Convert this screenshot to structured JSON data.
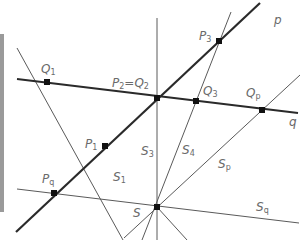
{
  "diagram": {
    "center": {
      "name": "S",
      "x": 157,
      "y": 207
    },
    "lines": [
      {
        "id": "p",
        "label": "p",
        "style": "thick",
        "x1": 16,
        "y1": 232,
        "x2": 260,
        "y2": 3
      },
      {
        "id": "q",
        "label": "q",
        "style": "thick",
        "x1": 17,
        "y1": 79,
        "x2": 298,
        "y2": 113
      },
      {
        "id": "S1",
        "label": "S1",
        "style": "thin",
        "x1": 17,
        "y1": 48,
        "x2": 123,
        "y2": 240
      },
      {
        "id": "S3",
        "label": "S3",
        "style": "thin",
        "x1": 157,
        "y1": 18,
        "x2": 157,
        "y2": 240
      },
      {
        "id": "S4",
        "label": "S4",
        "style": "thin",
        "x1": 231,
        "y1": 12,
        "x2": 142,
        "y2": 240
      },
      {
        "id": "Sp",
        "label": "Sp",
        "style": "thin",
        "x1": 300,
        "y1": 75,
        "x2": 124,
        "y2": 238
      },
      {
        "id": "Sq",
        "label": "Sq",
        "style": "thin",
        "x1": 17,
        "y1": 189,
        "x2": 299,
        "y2": 223
      },
      {
        "id": "extra",
        "label": "",
        "style": "thin",
        "x1": 157,
        "y1": 207,
        "x2": 187,
        "y2": 240
      }
    ],
    "points": [
      {
        "name": "Q1",
        "x": 47,
        "y": 82
      },
      {
        "name": "P2=Q2",
        "x": 157,
        "y": 98
      },
      {
        "name": "Q3",
        "x": 196,
        "y": 101
      },
      {
        "name": "Qp",
        "x": 262,
        "y": 110
      },
      {
        "name": "P3",
        "x": 219,
        "y": 41
      },
      {
        "name": "P1",
        "x": 105,
        "y": 146
      },
      {
        "name": "Pq",
        "x": 54,
        "y": 193
      },
      {
        "name": "S",
        "x": 157,
        "y": 207
      }
    ],
    "labels": {
      "p": {
        "main": "p",
        "sub": ""
      },
      "q": {
        "main": "q",
        "sub": ""
      },
      "Q1": {
        "main": "Q",
        "sub": "1"
      },
      "P2Q2": {
        "main": "P",
        "sub": "2",
        "eq": "=Q",
        "sub2": "2"
      },
      "Q3": {
        "main": "Q",
        "sub": "3"
      },
      "Qp": {
        "main": "Q",
        "sub": "p"
      },
      "P3": {
        "main": "P",
        "sub": "3"
      },
      "P1": {
        "main": "P",
        "sub": "1"
      },
      "Pq": {
        "main": "P",
        "sub": "q"
      },
      "S": {
        "main": "S",
        "sub": ""
      },
      "S1": {
        "main": "S",
        "sub": "1"
      },
      "S3": {
        "main": "S",
        "sub": "3"
      },
      "S4": {
        "main": "S",
        "sub": "4"
      },
      "Sp": {
        "main": "S",
        "sub": "p"
      },
      "Sq": {
        "main": "S",
        "sub": "q"
      }
    },
    "colors": {
      "thick": "#2a2a2a",
      "thin": "#5a5a5a",
      "point": "#111111",
      "label": "#6a6a6a"
    }
  }
}
